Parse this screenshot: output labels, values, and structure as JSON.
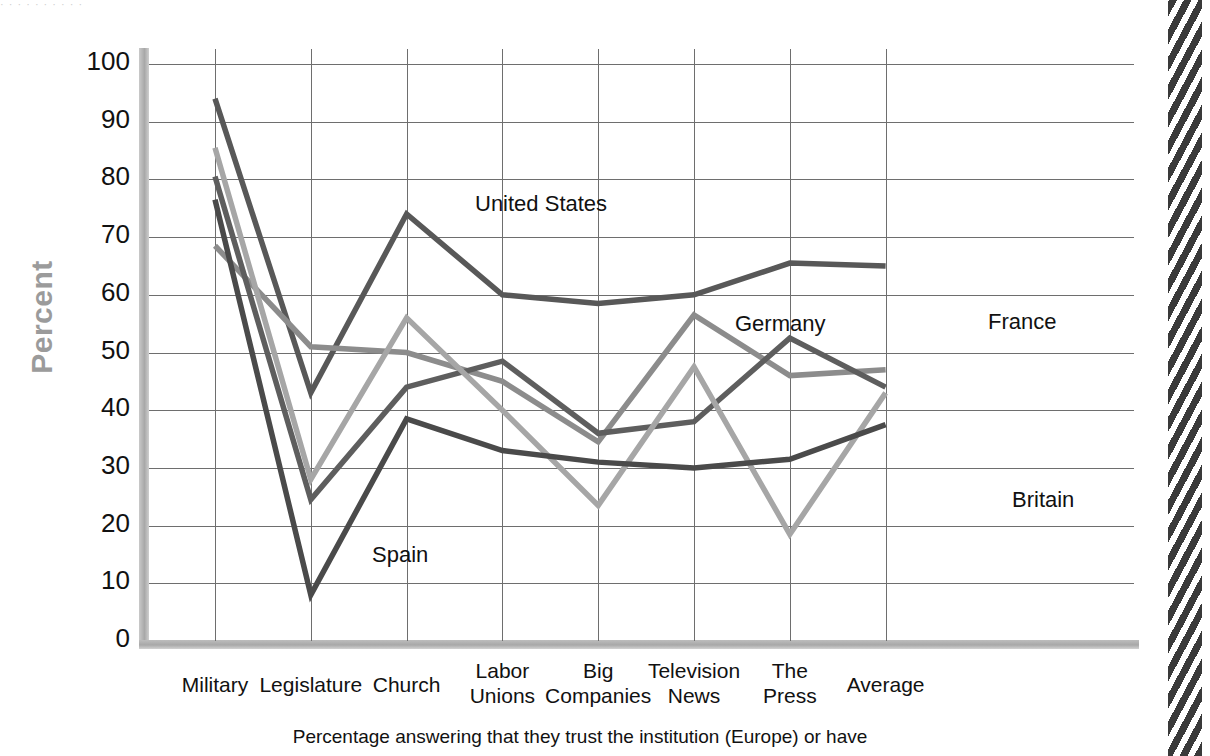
{
  "top_strip_text": "· ·  ·  ·   ·      ·        ·      ·    ·     ·",
  "axis": {
    "ylabel": "Percent",
    "yticks": [
      "100",
      "90",
      "80",
      "70",
      "60",
      "50",
      "40",
      "30",
      "20",
      "10",
      "0"
    ]
  },
  "caption": "Percentage answering that they trust the institution (Europe) or have",
  "series_labels": {
    "united_states": "United States",
    "germany": "Germany",
    "france": "France",
    "britain": "Britain",
    "spain": "Spain"
  },
  "chart_data": {
    "type": "line",
    "title": "",
    "xlabel": "",
    "ylabel": "Percent",
    "ylim": [
      0,
      100
    ],
    "ytick_step": 10,
    "grid": true,
    "legend": "inline-labels",
    "categories": [
      "Military",
      "Legislature",
      "Church",
      "Labor Unions",
      "Big Companies",
      "Television News",
      "The Press",
      "Average"
    ],
    "series": [
      {
        "name": "United States",
        "color": "#585858",
        "values": [
          94,
          43,
          74,
          60,
          58.5,
          60,
          65.5,
          65
        ]
      },
      {
        "name": "Germany",
        "color": "#8c8c8c",
        "values": [
          68.5,
          51,
          50,
          45,
          34.5,
          56.5,
          46,
          47
        ]
      },
      {
        "name": "France",
        "color": "#5e5e5e",
        "values": [
          80.5,
          24.5,
          44,
          48.5,
          36,
          38,
          52.5,
          44
        ]
      },
      {
        "name": "Britain",
        "color": "#a6a6a6",
        "values": [
          85.5,
          28,
          56,
          40,
          23.5,
          47.5,
          18.5,
          43
        ]
      },
      {
        "name": "Spain",
        "color": "#4a4a4a",
        "values": [
          76.5,
          8,
          38.5,
          33,
          31,
          30,
          31.5,
          37.5
        ]
      }
    ]
  }
}
